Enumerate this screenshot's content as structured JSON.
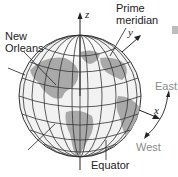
{
  "diagram": {
    "labels": {
      "new_orleans_line1": "New",
      "new_orleans_line2": "Orleans",
      "prime_meridian_line1": "Prime",
      "prime_meridian_line2": "meridian",
      "equator": "Equator",
      "east": "East",
      "west": "West"
    },
    "axes": {
      "z": "z",
      "y": "y",
      "x": "x"
    },
    "colors": {
      "ocean": "#f2f2f2",
      "land": "#a9a9a9",
      "grid": "#333333",
      "label_gray": "#8a8a8a",
      "marker_square": "#bdbdbd"
    }
  }
}
